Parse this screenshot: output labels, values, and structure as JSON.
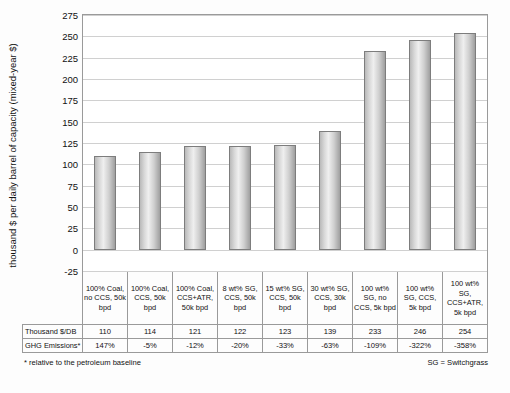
{
  "chart_data": {
    "type": "bar",
    "title": "",
    "xlabel": "",
    "ylabel": "thousand $ per daily barrel of capacity (mixed-year $)",
    "ylim": [
      -25,
      275
    ],
    "yticks": [
      "275",
      "250",
      "225",
      "200",
      "175",
      "150",
      "125",
      "100",
      "75",
      "50",
      "25",
      "0",
      "-25"
    ],
    "grid": true,
    "legend_position": "none",
    "categories": [
      "100% Coal, no CCS, 50k bpd",
      "100% Coal, CCS, 50k bpd",
      "100% Coal, CCS+ATR, 50k bpd",
      "8 wt% SG, CCS, 50k bpd",
      "15 wt% SG, CCS, 50k bpd",
      "30 wt% SG, CCS, 30k bpd",
      "100 wt% SG, no CCS, 5k bpd",
      "100 wt% SG, CCS, 5k bpd",
      "100 wt% SG, CCS+ATR, 5k bpd"
    ],
    "values": [
      110,
      114,
      121,
      122,
      123,
      139,
      233,
      246,
      254
    ],
    "series": [
      {
        "name": "Thousand $/DB",
        "values": [
          "110",
          "114",
          "121",
          "122",
          "123",
          "139",
          "233",
          "246",
          "254"
        ]
      },
      {
        "name": "GHG Emissions*",
        "values": [
          "147%",
          "-5%",
          "-12%",
          "-20%",
          "-33%",
          "-63%",
          "-109%",
          "-322%",
          "-358%"
        ]
      }
    ]
  },
  "table": {
    "row_headers": [
      "Thousand $/DB",
      "GHG Emissions*"
    ]
  },
  "footnotes": {
    "left": "* relative to the petroleum baseline",
    "right": "SG = Switchgrass"
  }
}
